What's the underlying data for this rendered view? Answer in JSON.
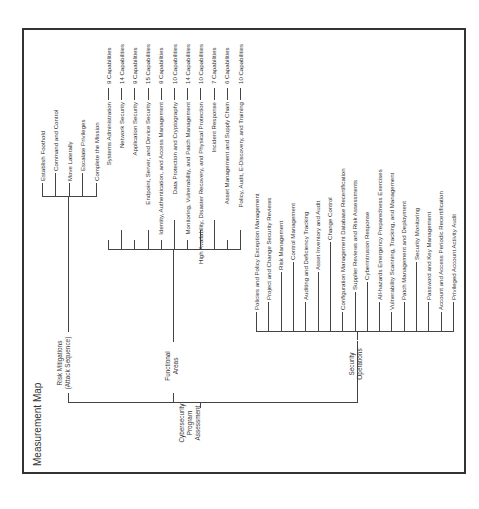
{
  "title": "Measurement Map",
  "root": {
    "label_lines": [
      "Cybersecurity",
      "Program",
      "Assessment"
    ]
  },
  "branches": {
    "risk_mitigations": {
      "label_lines": [
        "Risk Mitigations",
        "(Attack Sequence)"
      ],
      "items": [
        "Establish Foothold",
        "Command and Control",
        "Move Laterally",
        "Escalate Privileges",
        "Complete the Mission"
      ]
    },
    "functional_areas": {
      "label_lines": [
        "Functional",
        "Areas"
      ],
      "items": [
        {
          "label": "Systems Administration",
          "capabilities": "9 Capabilities"
        },
        {
          "label": "Network Security",
          "capabilities": "14 Capabilities"
        },
        {
          "label": "Application Security",
          "capabilities": "9 Capabilities"
        },
        {
          "label": "Endpoint, Server, and Device Security",
          "capabilities": "15 Capabilities"
        },
        {
          "label": "Identity, Authentication, and Access Management",
          "capabilities": "9 Capabilities"
        },
        {
          "label": "Data Protection and Cryptography",
          "capabilities": "10 Capabilities"
        },
        {
          "label": "Monitoring, Vulnerability, and Patch Management",
          "capabilities": "14 Capabilities"
        },
        {
          "label": "High Availability, Disaster Recovery, and Physical Protection",
          "capabilities": "10 Capabilities"
        },
        {
          "label": "Incident Response",
          "capabilities": "7 Capabilities"
        },
        {
          "label": "Asset Management and Supply Chain",
          "capabilities": "6 Capabilities"
        },
        {
          "label": "Policy, Audit, E-Discovery, and Training",
          "capabilities": "10 Capabilities"
        }
      ]
    },
    "security_operations": {
      "label_lines": [
        "Security",
        "Operations"
      ],
      "items": [
        "Policies and Policy Exception Management",
        "Project and Change Security Reviews",
        "Risk Management",
        "Control Management",
        "Auditing and Deficiency Tracking",
        "Asset Inventory and Audit",
        "Change Control",
        "Configuration Management Database Recertification",
        "Supplier Reviews and Risk Assessments",
        "Cyberintrusion Response",
        "All-hazards Emergency Preparedness Exercises",
        "Vulnerability Scanning, Tracking, and Management",
        "Patch Management and Deployment",
        "Security Monitoring",
        "Password and Key Management",
        "Account and Access Periodic Recertification",
        "Privileged Account Activity Audit"
      ]
    }
  }
}
